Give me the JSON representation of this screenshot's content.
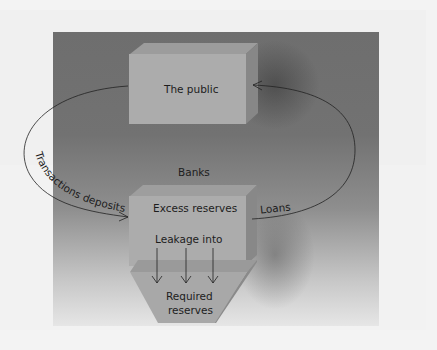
{
  "diagram": {
    "boxes": {
      "public": "The public",
      "banks_label": "Banks",
      "excess": "Excess reserves",
      "leakage": "Leakage into",
      "required_line1": "Required",
      "required_line2": "reserves"
    },
    "arrows": {
      "left": "Transactions deposits",
      "right": "Loans"
    },
    "colors": {
      "background_dark": "#6e6e6e",
      "box_face": "#a9a9a9",
      "box_top": "#9a9a9a",
      "box_side": "#858585",
      "text": "#1d1d1d",
      "page": "#f3f3f3"
    }
  }
}
